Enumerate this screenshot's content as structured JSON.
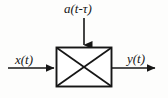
{
  "figure": {
    "type": "block-diagram",
    "background_color": "#fdfdfc",
    "line_color": "#161616"
  },
  "labels": {
    "input_signal": "x(t)",
    "output_signal": "y(t)",
    "control_signal": "a(t-τ)"
  },
  "block": {
    "name": "multiplier-block",
    "symbol": "X",
    "x": 56,
    "y": 47,
    "width": 56,
    "height": 40,
    "border_color": "#161616",
    "fill_color": "#ffffff"
  },
  "arrows": {
    "input": {
      "name": "input-arrow",
      "from_x": 8,
      "from_y": 68,
      "to_x": 56,
      "to_y": 68,
      "direction": "right"
    },
    "output": {
      "name": "output-arrow",
      "from_x": 112,
      "from_y": 68,
      "to_x": 163,
      "to_y": 68,
      "direction": "right"
    },
    "control": {
      "name": "control-arrow",
      "from_x": 84,
      "from_y": 18,
      "to_x": 84,
      "to_y": 47,
      "direction": "down"
    }
  }
}
